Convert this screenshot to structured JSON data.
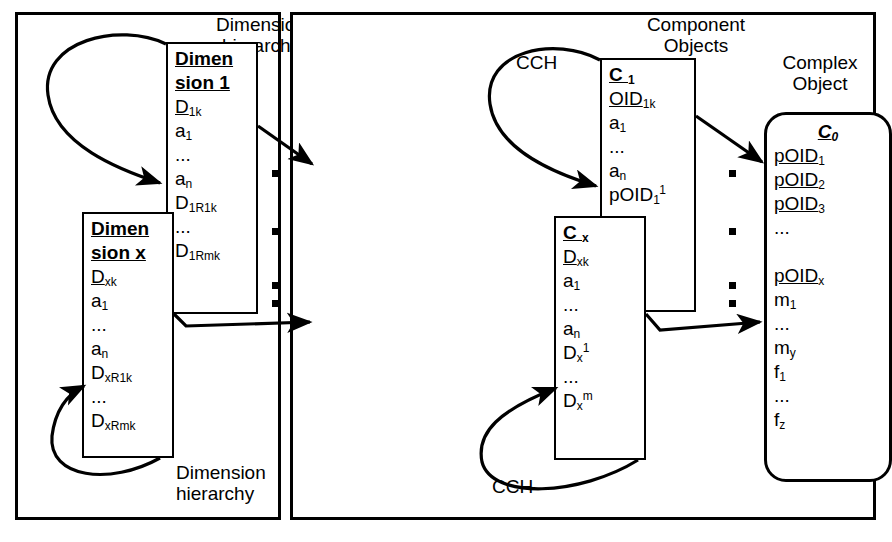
{
  "figure": {
    "panels": [
      {
        "id": "dimensional-model",
        "captions": {
          "top": "Dimension\nhierarchy",
          "bottom": "Dimension\nhierarchy"
        },
        "boxes": [
          {
            "id": "dimension-1",
            "title": [
              "Dimen",
              "sion 1"
            ],
            "fields": [
              "D<sub>1k</sub>",
              "a<sub>1</sub>",
              "...",
              "a<sub>n</sub>",
              "D<sub>1R1k</sub>",
              "...",
              "D<sub>1Rmk</sub>"
            ],
            "key_fields": [
              0
            ]
          },
          {
            "id": "dimension-x",
            "title": [
              "Dimen",
              "sion x"
            ],
            "fields": [
              "D<sub>xk</sub>",
              "a<sub>1</sub>",
              "...",
              "a<sub>n</sub>",
              "D<sub>xR1k</sub>",
              "...",
              "D<sub>xRmk</sub>"
            ],
            "key_fields": [
              0
            ]
          },
          {
            "id": "fact-table",
            "title": "Fact Table",
            "fields": [
              "D<sub>1k</sub>",
              "D<sub>2k</sub>",
              "D<sub>3k</sub>",
              "...",
              "",
              "D<sub>xk</sub>",
              "m<sub>1</sub>",
              "...",
              "m<sub>y</sub>",
              "f<sub>1</sub>",
              "...",
              "f<sub>z</sub>"
            ],
            "key_fields": [
              0,
              1,
              2,
              5
            ]
          }
        ]
      },
      {
        "id": "object-model",
        "captions": {
          "top": "Component\nObjects",
          "right": "Complex\nObject",
          "loop_top": "CCH",
          "loop_bottom": "CCH"
        },
        "boxes": [
          {
            "id": "component-c1",
            "title": "C <sub>1</sub>",
            "fields": [
              "OID<sub>1k</sub>",
              "a<sub>1</sub>",
              "...",
              "a<sub>n</sub>",
              "pOID<sub>1</sub><sup>1</sup>",
              "...",
              "D<sub>1</sub><sup>m</sup>"
            ],
            "key_fields": [
              0
            ]
          },
          {
            "id": "component-cx",
            "title": "C <sub>x</sub>",
            "fields": [
              "D<sub>xk</sub>",
              "a<sub>1</sub>",
              "...",
              "a<sub>n</sub>",
              "D<sub>x</sub><sup>1</sup>",
              "...",
              "D<sub>x</sub><sup>m</sup>"
            ],
            "key_fields": [
              0
            ]
          },
          {
            "id": "complex-object-c0",
            "title": "C<sub>0</sub>",
            "fields": [
              "pOID<sub>1</sub>",
              "pOID<sub>2</sub>",
              "pOID<sub>3</sub>",
              "...",
              "",
              "pOID<sub>x</sub>",
              "m<sub>1</sub>",
              "...",
              "m<sub>y</sub>",
              "f<sub>1</sub>",
              "...",
              "f<sub>z</sub>"
            ],
            "key_fields": [
              0,
              1,
              2,
              5
            ]
          }
        ]
      }
    ],
    "colors": {
      "stroke": "#000000",
      "background": "#ffffff",
      "shadow": "#b9b9b9"
    }
  }
}
